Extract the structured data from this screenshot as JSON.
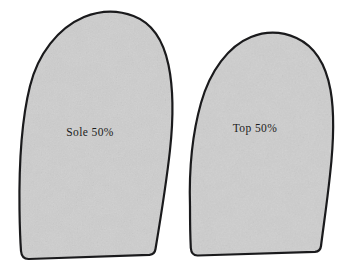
{
  "figure": {
    "name": "shoe-pattern-pieces-diagram",
    "background_color": "#ffffff",
    "width": 351,
    "height": 269
  },
  "style": {
    "outline_color": "#1a1a1c",
    "outline_width": 2.2,
    "fill_color": "#cfcfcf",
    "fill_color_light": "#d8d8d8",
    "fill_color_dark": "#c3c3c3",
    "label_color": "#1c1c20"
  },
  "pieces": [
    {
      "id": "sole-piece",
      "label": "Sole 50%",
      "label_x": 90,
      "label_y": 133,
      "path": "M 19.5 209.5 C 19.0 170.0 21.5 120.0 30.0 86.0 C 38.0 54.0 58.0 28.0 84.0 17.0 C 100.0 10.5 118.0 10.0 133.5 16.0 C 152.0 23.0 163.5 41.0 168.5 65.0 C 173.5 89.0 173.5 118.0 170.0 150.0 C 166.5 182.0 161.0 216.0 155.5 249.0 C 155.0 252.5 153.0 254.5 149.5 254.8 L 29.0 259.0 C 24.5 259.2 21.5 256.5 21.0 251.0 C 20.2 240.0 19.7 224.0 19.5 209.5 Z"
    },
    {
      "id": "top-piece",
      "label": "Top 50%",
      "label_x": 255,
      "label_y": 129,
      "path": "M 190.0 206.0 C 189.0 172.0 192.5 133.0 201.0 103.0 C 210.0 71.0 228.5 46.0 251.0 37.0 C 266.0 31.0 282.0 31.5 296.5 38.0 C 315.0 46.5 326.0 65.0 330.5 90.0 C 335.0 115.0 333.5 144.0 330.0 175.0 C 327.0 203.0 323.5 226.0 321.0 246.0 C 320.6 249.5 318.6 251.5 315.0 251.8 L 198.0 255.5 C 194.0 255.7 191.2 253.0 190.8 248.0 C 190.2 236.0 190.0 219.0 190.0 206.0 Z"
    }
  ]
}
